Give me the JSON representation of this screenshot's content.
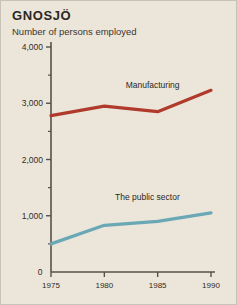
{
  "chart_data": {
    "type": "line",
    "title": "GNOSJÖ",
    "subtitle": "Number of persons employed",
    "xlabel": "",
    "ylabel": "",
    "x": [
      1975,
      1980,
      1985,
      1990
    ],
    "xticklabels": [
      "1975",
      "1980",
      "1985",
      "1990"
    ],
    "yticklabels": [
      "4,000",
      "3,000",
      "2,000",
      "1,000"
    ],
    "ytickvalues": [
      4000,
      3000,
      2000,
      1000
    ],
    "yminorticks": [
      3500,
      2500,
      1500,
      500
    ],
    "origin_label": "0",
    "xlim": [
      1973.5,
      1991.5
    ],
    "ylim": [
      0,
      4000
    ],
    "grid": false,
    "legend_position": "inline-labels",
    "series": [
      {
        "name": "Manufacturing",
        "color": "#b03b2c",
        "values": [
          2780,
          2950,
          2850,
          3230
        ],
        "label_x": 1982.0,
        "label_y": 3300
      },
      {
        "name": "The public sector",
        "color": "#6ba8b5",
        "values": [
          500,
          830,
          900,
          1050
        ],
        "label_x": 1981.0,
        "label_y": 1320
      }
    ]
  },
  "colors": {
    "background": "#ece6da",
    "axis": "#575149",
    "text": "#2b2722",
    "manufacturing": "#b03b2c",
    "public_sector": "#6ba8b5"
  }
}
